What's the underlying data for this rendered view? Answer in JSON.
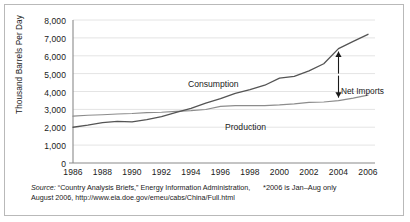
{
  "chart_data": {
    "type": "line",
    "title": "",
    "xlabel": "",
    "ylabel": "Thousand Barrels Per Day",
    "xlim": [
      1986,
      2006
    ],
    "ylim": [
      0,
      8000
    ],
    "yticks": [
      "0",
      "1,000",
      "2,000",
      "3,000",
      "4,000",
      "5,000",
      "6,000",
      "7,000",
      "8,000"
    ],
    "ytick_values": [
      0,
      1000,
      2000,
      3000,
      4000,
      5000,
      6000,
      7000,
      8000
    ],
    "xticks": [
      "1986",
      "1988",
      "1990",
      "1992",
      "1994",
      "1996",
      "1998",
      "2000",
      "2002",
      "2004",
      "2006"
    ],
    "xtick_values": [
      1986,
      1988,
      1990,
      1992,
      1994,
      1996,
      1998,
      2000,
      2002,
      2004,
      2006
    ],
    "grid": true,
    "legend_position": "inline-labels",
    "x": [
      1986,
      1987,
      1988,
      1989,
      1990,
      1991,
      1992,
      1993,
      1994,
      1995,
      1996,
      1997,
      1998,
      1999,
      2000,
      2001,
      2002,
      2003,
      2004,
      2005,
      2006
    ],
    "series": [
      {
        "name": "Consumption",
        "label": "Consumption",
        "color": "#545454",
        "values": [
          2000,
          2120,
          2260,
          2330,
          2300,
          2430,
          2600,
          2830,
          3050,
          3350,
          3600,
          3900,
          4100,
          4350,
          4750,
          4850,
          5150,
          5550,
          6400,
          6800,
          7200
        ]
      },
      {
        "name": "Production",
        "label": "Production",
        "color": "#8c8c8c",
        "values": [
          2620,
          2670,
          2700,
          2740,
          2770,
          2820,
          2840,
          2890,
          2930,
          2990,
          3170,
          3210,
          3210,
          3210,
          3250,
          3310,
          3390,
          3410,
          3490,
          3630,
          3800
        ]
      }
    ],
    "annotations": [
      {
        "name": "net-imports",
        "text": "Net Imports",
        "type": "double-arrow",
        "x": 2004,
        "y_top": 6400,
        "y_bottom": 3490
      }
    ]
  },
  "footer": {
    "source_word": "Source:",
    "source_line1": " “Country Analysis Briefs,” Energy Information Administration,",
    "source_line2": "August 2006, http://www.eia.doe.gov/emeu/cabs/China/Full.html",
    "footnote": "*2006 is Jan–Aug only"
  },
  "colors": {
    "border": "#b9b9b9",
    "grid": "#e4e4e4",
    "axis": "#8a8a8a",
    "consumption": "#545454",
    "production": "#8c8c8c",
    "text": "#1a1a1a"
  }
}
